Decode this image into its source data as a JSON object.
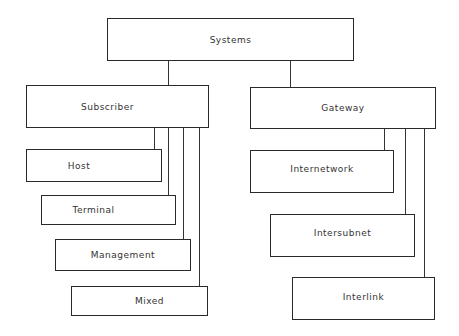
{
  "diagram": {
    "type": "hierarchy",
    "root": {
      "label": "Systems"
    },
    "branches": [
      {
        "label": "Subscriber",
        "children": [
          "Host",
          "Terminal",
          "Management",
          "Mixed"
        ]
      },
      {
        "label": "Gateway",
        "children": [
          "Internetwork",
          "Intersubnet",
          "Interlink"
        ]
      }
    ]
  },
  "nodes": {
    "systems": "Systems",
    "subscriber": "Subscriber",
    "gateway": "Gateway",
    "host": "Host",
    "terminal": "Terminal",
    "management": "Management",
    "mixed": "Mixed",
    "internetwork": "Internetwork",
    "intersubnet": "Intersubnet",
    "interlink": "Interlink"
  }
}
